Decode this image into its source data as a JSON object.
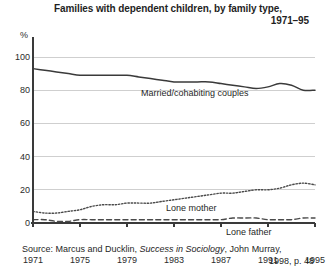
{
  "chart_data": {
    "type": "line",
    "title": "Families with dependent children, by family type,",
    "title_line2": "1971–95",
    "xlabel": "",
    "ylabel": "%",
    "y_unit": "%",
    "xlim": [
      1971,
      1995
    ],
    "ylim": [
      0,
      100
    ],
    "grid": true,
    "legend_position": "inline-annotations",
    "y_ticks": [
      100,
      80,
      60,
      40,
      20,
      0
    ],
    "x_ticks": [
      1971,
      1975,
      1979,
      1983,
      1987,
      1991,
      1995
    ],
    "x": [
      1971,
      1972,
      1973,
      1974,
      1975,
      1976,
      1977,
      1978,
      1979,
      1980,
      1981,
      1982,
      1983,
      1984,
      1985,
      1986,
      1987,
      1988,
      1989,
      1990,
      1991,
      1992,
      1993,
      1994,
      1995
    ],
    "series": [
      {
        "name": "Married/cohabiting couples",
        "style": "solid",
        "color": "#3a3a3a",
        "values": [
          93,
          92,
          91,
          90,
          89,
          89,
          89,
          89,
          89,
          88,
          87,
          86,
          85,
          85,
          85,
          85,
          84,
          83,
          82,
          81,
          82,
          84,
          83,
          80,
          80
        ]
      },
      {
        "name": "Lone mother",
        "style": "dotted",
        "color": "#4a4a4a",
        "values": [
          7,
          6,
          6,
          7,
          8,
          10,
          11,
          11,
          12,
          12,
          12,
          13,
          14,
          15,
          16,
          17,
          18,
          18,
          19,
          20,
          20,
          21,
          23,
          24,
          23
        ]
      },
      {
        "name": "Lone father",
        "style": "dashed",
        "color": "#4a4a4a",
        "values": [
          2,
          2,
          1,
          1,
          2,
          2,
          2,
          2,
          2,
          2,
          2,
          2,
          2,
          2,
          2,
          2,
          2,
          3,
          3,
          3,
          2,
          2,
          2,
          3,
          3
        ]
      }
    ],
    "annotations": [
      {
        "text": "Married/cohabiting couples",
        "series": "Married/cohabiting couples"
      },
      {
        "text": "Lone mother",
        "series": "Lone mother"
      },
      {
        "text": "Lone father",
        "series": "Lone father"
      }
    ]
  },
  "source": {
    "line1_prefix": "Source: Marcus and Ducklin, ",
    "line1_italic": "Success in Sociology",
    "line1_suffix": ", John Murray,",
    "line2": "1998, p. 48"
  }
}
